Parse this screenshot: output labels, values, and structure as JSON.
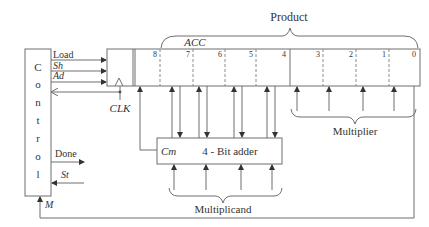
{
  "diagram": {
    "title": "Product",
    "control": {
      "letters": [
        "C",
        "o",
        "n",
        "t",
        "r",
        "o",
        "l"
      ],
      "outputs": [
        "Load",
        "Sh",
        "Ad"
      ],
      "done_label": "Done",
      "start_label": "St",
      "feedback_label": "M"
    },
    "register": {
      "acc_label": "ACC",
      "clock_label": "CLK",
      "bits": [
        "8",
        "7",
        "6",
        "5",
        "4",
        "3",
        "2",
        "1",
        "0"
      ]
    },
    "adder": {
      "label": "4 - Bit adder",
      "carry_label": "Cm"
    },
    "braces": {
      "product": "Product",
      "multiplier": "Multiplier",
      "multiplicand": "Multiplicand"
    }
  }
}
